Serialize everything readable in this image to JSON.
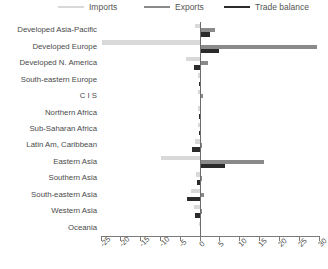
{
  "legend": {
    "items": [
      {
        "label": "Imports",
        "color": "#d9d9d9",
        "x": 58
      },
      {
        "label": "Exports",
        "color": "#8a8a8a",
        "x": 144
      },
      {
        "label": "Trade balance",
        "color": "#2b2b2b",
        "x": 224
      }
    ]
  },
  "axis": {
    "ticks": [
      "-25",
      "-20",
      "-15",
      "-10",
      "-5",
      "0",
      "5",
      "10",
      "15",
      "20",
      "25",
      "30"
    ],
    "min": -25,
    "max": 30,
    "step": 5
  },
  "chart_data": {
    "type": "bar",
    "orientation": "horizontal",
    "title": "",
    "xlabel": "",
    "ylabel": "",
    "xlim": [
      -25,
      30
    ],
    "grid": false,
    "legend_position": "top",
    "categories": [
      "Developed Asia-Pacific",
      "Developed Europe",
      "Developed N. America",
      "South-eastern Europe",
      "C I S",
      "Northern Africa",
      "Sub-Saharan Africa",
      "Latin Am, Caribbean",
      "Eastern Asia",
      "Southern Asia",
      "South-eastern Asia",
      "Western Asia",
      "Oceania"
    ],
    "series": [
      {
        "name": "Imports",
        "color": "#d9d9d9",
        "values": [
          -1.2,
          -24.5,
          -3.5,
          -0.4,
          -0.5,
          -0.3,
          -0.4,
          -1.1,
          -9.8,
          -1.0,
          -2.2,
          -1.3,
          -0.1
        ]
      },
      {
        "name": "Exports",
        "color": "#8a8a8a",
        "values": [
          4.0,
          29.5,
          2.2,
          0.3,
          0.9,
          0.2,
          0.3,
          0.7,
          16.3,
          0.6,
          1.1,
          0.5,
          0.1
        ]
      },
      {
        "name": "Trade balance",
        "color": "#2b2b2b",
        "values": [
          2.6,
          5.0,
          -1.3,
          -0.2,
          0.4,
          -0.1,
          -0.1,
          -2.0,
          6.4,
          -0.6,
          -3.2,
          -1.2,
          0.0
        ]
      }
    ]
  }
}
